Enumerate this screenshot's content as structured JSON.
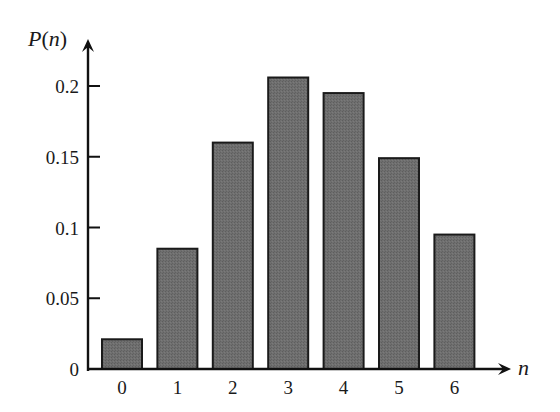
{
  "chart_data": {
    "type": "bar",
    "title": "",
    "xlabel": "n",
    "ylabel": "P(n)",
    "categories": [
      "0",
      "1",
      "2",
      "3",
      "4",
      "5",
      "6"
    ],
    "values": [
      0.021,
      0.085,
      0.16,
      0.206,
      0.195,
      0.149,
      0.095
    ],
    "ylim": [
      0,
      0.22
    ],
    "yticks": [
      0,
      0.05,
      0.1,
      0.15,
      0.2
    ],
    "ytick_labels": [
      "0",
      "0.05",
      "0.1",
      "0.15",
      "0.2"
    ],
    "grid": false,
    "legend": null,
    "bar_color": "#6b6b6b",
    "bar_edge_color": "#1a1a1a"
  },
  "labels": {
    "y_axis_P": "P",
    "y_axis_paren_open": "(",
    "y_axis_n": "n",
    "y_axis_paren_close": ")",
    "x_axis": "n"
  }
}
